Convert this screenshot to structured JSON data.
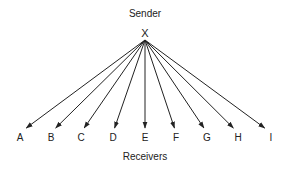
{
  "diagram": {
    "sender": {
      "title": "Sender",
      "node_label": "X",
      "x": 145,
      "y": 34
    },
    "receivers_title": "Receivers",
    "receivers": [
      {
        "label": "A",
        "x": 20
      },
      {
        "label": "B",
        "x": 51
      },
      {
        "label": "C",
        "x": 81
      },
      {
        "label": "D",
        "x": 113
      },
      {
        "label": "E",
        "x": 145
      },
      {
        "label": "F",
        "x": 176
      },
      {
        "label": "G",
        "x": 207
      },
      {
        "label": "H",
        "x": 238
      },
      {
        "label": "I",
        "x": 271
      }
    ],
    "edge_color": "#222222"
  }
}
